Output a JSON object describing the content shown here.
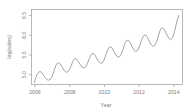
{
  "chart_data": {
    "type": "line",
    "title": "",
    "xlabel": "Year",
    "ylabel": "log(sales)",
    "xlim": [
      2005.8,
      2014.5
    ],
    "ylim": [
      4.75,
      6.65
    ],
    "grid": false,
    "legend": null,
    "x_ticks": [
      2006,
      2008,
      2010,
      2012,
      2014
    ],
    "x_tick_labels": [
      "2006",
      "2008",
      "2010",
      "2012",
      "2014"
    ],
    "y_ticks": [
      5.0,
      5.5,
      6.0,
      6.5
    ],
    "y_tick_labels": [
      "5.0",
      "5.5",
      "6.0",
      "6.5"
    ],
    "series": [
      {
        "name": "log(sales)",
        "color": "#8c8c8c",
        "x": [
          2005.96,
          2006.04,
          2006.13,
          2006.21,
          2006.29,
          2006.38,
          2006.46,
          2006.54,
          2006.63,
          2006.71,
          2006.79,
          2006.88,
          2006.96,
          2007.04,
          2007.13,
          2007.21,
          2007.29,
          2007.38,
          2007.46,
          2007.54,
          2007.63,
          2007.71,
          2007.79,
          2007.88,
          2007.96,
          2008.04,
          2008.13,
          2008.21,
          2008.29,
          2008.38,
          2008.46,
          2008.54,
          2008.63,
          2008.71,
          2008.79,
          2008.88,
          2008.96,
          2009.04,
          2009.13,
          2009.21,
          2009.29,
          2009.38,
          2009.46,
          2009.54,
          2009.63,
          2009.71,
          2009.79,
          2009.88,
          2009.96,
          2010.04,
          2010.13,
          2010.21,
          2010.29,
          2010.38,
          2010.46,
          2010.54,
          2010.63,
          2010.71,
          2010.79,
          2010.88,
          2010.96,
          2011.04,
          2011.13,
          2011.21,
          2011.29,
          2011.38,
          2011.46,
          2011.54,
          2011.63,
          2011.71,
          2011.79,
          2011.88,
          2011.96,
          2012.04,
          2012.13,
          2012.21,
          2012.29,
          2012.38,
          2012.46,
          2012.54,
          2012.63,
          2012.71,
          2012.79,
          2012.88,
          2012.96,
          2013.04,
          2013.13,
          2013.21,
          2013.29,
          2013.38,
          2013.46,
          2013.54,
          2013.63,
          2013.71,
          2013.79,
          2013.88,
          2013.96,
          2014.04,
          2014.13,
          2014.21,
          2014.29
        ],
        "y": [
          4.8,
          4.92,
          5.01,
          5.06,
          5.08,
          5.06,
          5.01,
          4.95,
          4.9,
          4.87,
          4.86,
          4.88,
          4.93,
          5.02,
          5.14,
          5.24,
          5.29,
          5.3,
          5.27,
          5.21,
          5.14,
          5.09,
          5.06,
          5.07,
          5.11,
          5.18,
          5.28,
          5.36,
          5.4,
          5.4,
          5.36,
          5.3,
          5.24,
          5.19,
          5.17,
          5.18,
          5.22,
          5.3,
          5.41,
          5.49,
          5.53,
          5.53,
          5.49,
          5.43,
          5.36,
          5.31,
          5.29,
          5.3,
          5.35,
          5.44,
          5.56,
          5.65,
          5.7,
          5.7,
          5.66,
          5.59,
          5.52,
          5.47,
          5.44,
          5.46,
          5.51,
          5.6,
          5.72,
          5.82,
          5.87,
          5.87,
          5.83,
          5.76,
          5.68,
          5.62,
          5.59,
          5.6,
          5.65,
          5.74,
          5.86,
          5.95,
          6.0,
          6.0,
          5.96,
          5.89,
          5.81,
          5.75,
          5.72,
          5.73,
          5.78,
          5.88,
          6.01,
          6.12,
          6.18,
          6.18,
          6.14,
          6.06,
          5.98,
          5.92,
          5.89,
          5.91,
          5.97,
          6.1,
          6.26,
          6.4,
          6.5
        ]
      }
    ]
  }
}
